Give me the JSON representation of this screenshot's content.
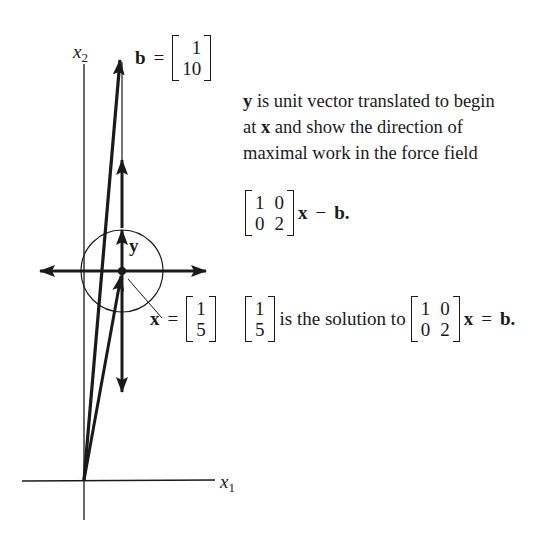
{
  "axes": {
    "x1_label": "x",
    "x1_sub": "1",
    "x2_label": "x",
    "x2_sub": "2"
  },
  "vectors": {
    "b": {
      "name": "b",
      "equals": "=",
      "components": [
        "1",
        "10"
      ]
    },
    "x": {
      "name": "x",
      "equals": "=",
      "components": [
        "1",
        "5"
      ]
    },
    "y": {
      "name": "y"
    }
  },
  "description": {
    "line1_bold": "y",
    "line1_rest": " is unit vector translated to begin",
    "line2_pre": "at ",
    "line2_bold": "x",
    "line2_rest": " and show the direction of",
    "line3": "maximal work in the force field"
  },
  "force_field": {
    "matrix": [
      [
        "1",
        "0"
      ],
      [
        "0",
        "2"
      ]
    ],
    "x": "x",
    "minus": "−",
    "b": "b",
    "period": "."
  },
  "solution": {
    "vector": [
      "1",
      "5"
    ],
    "text": "is the solution to",
    "matrix": [
      [
        "1",
        "0"
      ],
      [
        "0",
        "2"
      ]
    ],
    "x": "x",
    "equals": "=",
    "b": "b",
    "period": "."
  },
  "colors": {
    "ink": "#1a1a1a",
    "background": "#ffffff"
  }
}
